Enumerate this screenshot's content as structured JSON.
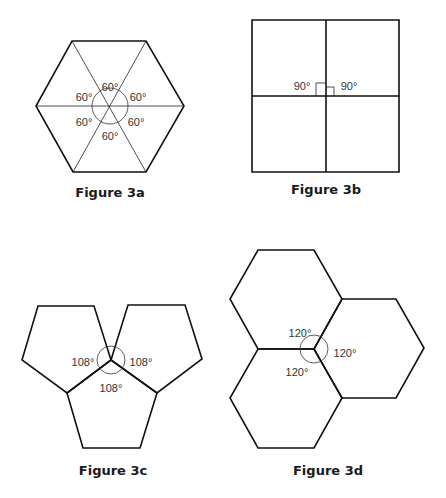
{
  "figures": [
    {
      "id": "3a",
      "caption": "Figure 3a",
      "caption_pos": [
        110,
        197
      ],
      "shape": "hexagon",
      "polygons": [
        [
          [
            72,
            41
          ],
          [
            146,
            41
          ],
          [
            184,
            106
          ],
          [
            146,
            172
          ],
          [
            73,
            172
          ],
          [
            36,
            106
          ]
        ]
      ],
      "spokes": [
        [
          [
            36,
            106
          ],
          [
            184,
            106
          ]
        ],
        [
          [
            72,
            41
          ],
          [
            146,
            172
          ]
        ],
        [
          [
            146,
            41
          ],
          [
            73,
            172
          ]
        ]
      ],
      "center": [
        110,
        106
      ],
      "circle_r": 18,
      "angles": [
        {
          "label": "60°",
          "pos": [
            110,
            87
          ]
        },
        {
          "label": "60°",
          "pos": [
            84,
            97
          ]
        },
        {
          "label": "60°",
          "pos": [
            138,
            97
          ]
        },
        {
          "label": "60°",
          "pos": [
            84,
            122
          ]
        },
        {
          "label": "60°",
          "pos": [
            136,
            122
          ]
        },
        {
          "label": "60°",
          "pos": [
            110,
            136
          ]
        }
      ]
    },
    {
      "id": "3b",
      "caption": "Figure 3b",
      "caption_pos": [
        326,
        194
      ],
      "shape": "square",
      "polygons": [
        [
          [
            252,
            20
          ],
          [
            399,
            20
          ],
          [
            399,
            172
          ],
          [
            252,
            172
          ]
        ]
      ],
      "spokes": [
        [
          [
            326,
            20
          ],
          [
            326,
            172
          ]
        ],
        [
          [
            252,
            96
          ],
          [
            399,
            96
          ]
        ]
      ],
      "right_angle_marks": [
        [
          [
            316,
            96
          ],
          [
            316,
            83
          ],
          [
            326,
            83
          ]
        ],
        [
          [
            326,
            87
          ],
          [
            334,
            87
          ],
          [
            334,
            96
          ]
        ]
      ],
      "angles": [
        {
          "label": "90°",
          "pos": [
            302,
            86
          ]
        },
        {
          "label": "90°",
          "pos": [
            349,
            86
          ]
        }
      ]
    },
    {
      "id": "3c",
      "caption": "Figure 3c",
      "caption_pos": [
        113,
        475
      ],
      "shape": "pentagon",
      "polygons": [
        [
          [
            38,
            306
          ],
          [
            94,
            306
          ],
          [
            111,
            360
          ],
          [
            67,
            393
          ],
          [
            22,
            360
          ]
        ],
        [
          [
            128,
            305
          ],
          [
            185,
            305
          ],
          [
            202,
            359
          ],
          [
            157,
            393
          ],
          [
            111,
            360
          ]
        ],
        [
          [
            111,
            360
          ],
          [
            157,
            393
          ],
          [
            140,
            448
          ],
          [
            83,
            448
          ],
          [
            67,
            393
          ]
        ]
      ],
      "center": [
        111,
        360
      ],
      "circle_r": 14,
      "angles": [
        {
          "label": "108°",
          "pos": [
            83,
            362
          ]
        },
        {
          "label": "108°",
          "pos": [
            141,
            362
          ]
        },
        {
          "label": "108°",
          "pos": [
            111,
            388
          ]
        }
      ]
    },
    {
      "id": "3d",
      "caption": "Figure 3d",
      "caption_pos": [
        328,
        475
      ],
      "shape": "hexagon-tiling",
      "polygons": [
        [
          [
            258,
            250
          ],
          [
            314,
            250
          ],
          [
            342,
            299
          ],
          [
            314,
            349
          ],
          [
            258,
            349
          ],
          [
            230,
            299
          ]
        ],
        [
          [
            342,
            299
          ],
          [
            396,
            299
          ],
          [
            424,
            348
          ],
          [
            396,
            398
          ],
          [
            342,
            398
          ],
          [
            314,
            349
          ]
        ],
        [
          [
            258,
            349
          ],
          [
            314,
            349
          ],
          [
            342,
            398
          ],
          [
            314,
            448
          ],
          [
            258,
            448
          ],
          [
            230,
            398
          ]
        ]
      ],
      "center": [
        314,
        349
      ],
      "circle_r": 14,
      "angles": [
        {
          "label": "120°",
          "pos": [
            300,
            333
          ]
        },
        {
          "label": "120°",
          "pos": [
            345,
            353
          ]
        },
        {
          "label": "120°",
          "pos": [
            297,
            372
          ]
        }
      ]
    }
  ],
  "colors": {
    "line": "#111111",
    "text": "#333333",
    "background": "#ffffff"
  }
}
